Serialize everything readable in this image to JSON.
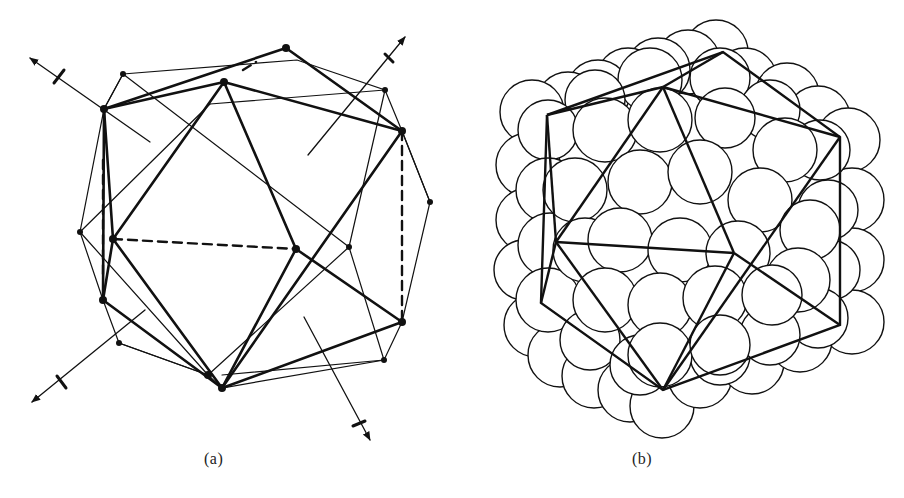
{
  "figure": {
    "panels": [
      {
        "id": "a",
        "label": "(a)",
        "description": "Icosahedron inscribed with twofold rotation axes (arrows) and overlapping thin polyhedron outline"
      },
      {
        "id": "b",
        "label": "(b)",
        "description": "Icosahedral close-packed arrangement of spheres with icosahedron edges overlaid"
      }
    ]
  },
  "colors": {
    "stroke": "#111111",
    "background": "#ffffff",
    "label": "#222222"
  }
}
